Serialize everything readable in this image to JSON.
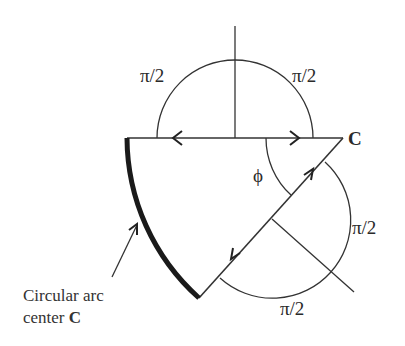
{
  "diagram": {
    "labels": {
      "angle_top_left": "π/2",
      "angle_top_right": "π/2",
      "angle_right": "π/2",
      "angle_bottom": "π/2",
      "phi": "ϕ",
      "point_c": "C"
    },
    "caption": {
      "line1": "Circular arc",
      "line2_prefix": "center ",
      "line2_bold": "C"
    },
    "colors": {
      "stroke": "#333333",
      "arc": "#1a1a1a",
      "background": "#ffffff"
    }
  }
}
